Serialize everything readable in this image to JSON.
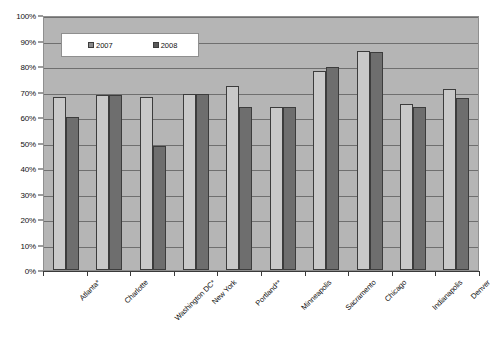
{
  "chart_data": {
    "type": "bar",
    "title": "",
    "subtitle": "",
    "xlabel": "",
    "ylabel": "",
    "ylim": [
      0,
      100
    ],
    "ytick_labels": [
      "0%",
      "10%",
      "20%",
      "30%",
      "40%",
      "50%",
      "60%",
      "70%",
      "80%",
      "90%",
      "100%"
    ],
    "ytick_values": [
      0,
      10,
      20,
      30,
      40,
      50,
      60,
      70,
      80,
      90,
      100
    ],
    "grid": true,
    "legend_position": "top-left-inside",
    "categories": [
      "Atlanta*",
      "Charlotte",
      "Washington DC*",
      "New York",
      "Portland**",
      "Minneapolis",
      "Sacramento",
      "Chicago",
      "Indianapolis",
      "Denver"
    ],
    "series": [
      {
        "name": "2007",
        "color": "#c9c9c9",
        "values": [
          68,
          68.5,
          68,
          69,
          72,
          64,
          78,
          86,
          65,
          71
        ]
      },
      {
        "name": "2008",
        "color": "#6e6e6e",
        "values": [
          60,
          68.5,
          48.5,
          69,
          64,
          64,
          79.5,
          85.5,
          64,
          67.5
        ]
      }
    ]
  },
  "legend": {
    "items": [
      {
        "label": "2007",
        "swatch": "legend-swatch-2007"
      },
      {
        "label": "2008",
        "swatch": "legend-swatch-2008"
      }
    ]
  },
  "colors": {
    "plot_background": "#b5b5b5",
    "gridline": "#6f6f6f",
    "axis": "#3a3a3a",
    "series_2007": "#c9c9c9",
    "series_2008": "#6e6e6e",
    "page_background": "#ffffff"
  }
}
